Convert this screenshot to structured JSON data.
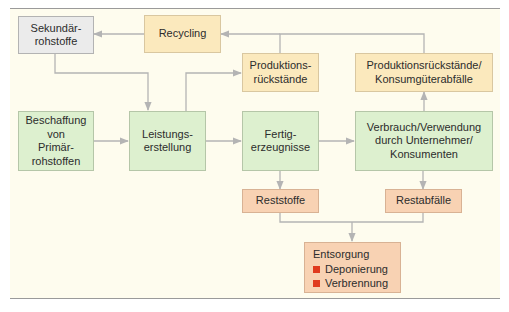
{
  "diagram": {
    "title": "",
    "nodes": {
      "sekundaer": {
        "label": "Sekundär-\nrohstoffe",
        "color": "#ebebeb"
      },
      "recycling": {
        "label": "Recycling",
        "color": "#fbe9bd"
      },
      "produktionsrueckstaende": {
        "label": "Produktions-\nrückstände",
        "color": "#fbe9bd"
      },
      "konsumgueterabfaelle": {
        "label": "Produktionsrückstände/\nKonsumgüterabfälle",
        "color": "#fbe9bd"
      },
      "beschaffung": {
        "label": "Beschaffung\nvon\nPrimär-\nrohstoffen",
        "color": "#ddf0cf"
      },
      "leistungserstellung": {
        "label": "Leistungs-\nerstellung",
        "color": "#ddf0cf"
      },
      "fertigerzeugnisse": {
        "label": "Fertig-\nerzeugnisse",
        "color": "#ddf0cf"
      },
      "verbrauch": {
        "label": "Verbrauch/Verwendung\ndurch Unternehmer/\nKonsumenten",
        "color": "#ddf0cf"
      },
      "reststoffe": {
        "label": "Reststoffe",
        "color": "#f8d2b3"
      },
      "restabfaelle": {
        "label": "Restabfälle",
        "color": "#f8d2b3"
      },
      "entsorgung": {
        "label": "Entsorgung",
        "color": "#f8d2b3",
        "items": [
          "Deponierung",
          "Verbrennung"
        ],
        "bullet_color": "#e03a1e"
      }
    },
    "edges": [
      {
        "from": "beschaffung",
        "to": "leistungserstellung"
      },
      {
        "from": "sekundaer",
        "to": "leistungserstellung"
      },
      {
        "from": "leistungserstellung",
        "to": "fertigerzeugnisse"
      },
      {
        "from": "leistungserstellung",
        "to": "produktionsrueckstaende"
      },
      {
        "from": "fertigerzeugnisse",
        "to": "verbrauch"
      },
      {
        "from": "verbrauch",
        "to": "konsumgueterabfaelle"
      },
      {
        "from": "produktionsrueckstaende",
        "to": "recycling"
      },
      {
        "from": "konsumgueterabfaelle",
        "to": "recycling"
      },
      {
        "from": "recycling",
        "to": "sekundaer"
      },
      {
        "from": "fertigerzeugnisse",
        "to": "reststoffe"
      },
      {
        "from": "verbrauch",
        "to": "restabfaelle"
      },
      {
        "from": "reststoffe",
        "to": "entsorgung"
      },
      {
        "from": "restabfaelle",
        "to": "entsorgung"
      }
    ],
    "connector_color": "#b4b4b4"
  }
}
